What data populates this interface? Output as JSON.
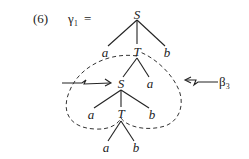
{
  "example_number": "(6)",
  "tree_name": "γ₁",
  "equals": "=",
  "beta_label": "β₃",
  "nodes": {
    "root_S": "S",
    "root_a": "a",
    "root_T": "T",
    "root_b": "b",
    "mid_S": "S",
    "mid_a_right": "a",
    "low_a": "a",
    "low_T": "T",
    "low_b": "b",
    "leaf_a": "a",
    "leaf_b": "b"
  }
}
